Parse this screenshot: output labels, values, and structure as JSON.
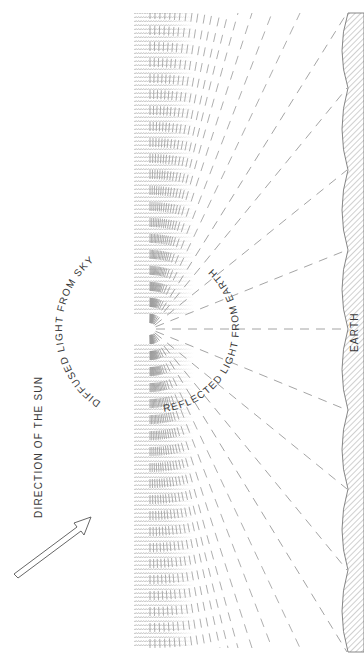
{
  "diagram": {
    "labels": {
      "diffused": "DIFFUSED LIGHT FROM SKY",
      "reflected": "REFLECTED LIGHT FROM EARTH",
      "earth": "EARTH",
      "sun_direction": "DIRECTION OF THE SUN"
    },
    "colors": {
      "ink": "#3a3a3a",
      "dash": "#9a9a9a",
      "stipple": "#b5b5b5",
      "hatch": "#8a8a8a"
    },
    "center_point": {
      "x": 150,
      "y": 329
    },
    "stipple_band": {
      "x": 134,
      "top": 13,
      "bottom": 648,
      "gap_top": 316,
      "gap_bottom": 343
    },
    "earth_vertices_y": [
      13,
      88,
      170,
      250,
      329,
      410,
      489,
      570,
      652
    ],
    "earth_x": 348
  }
}
